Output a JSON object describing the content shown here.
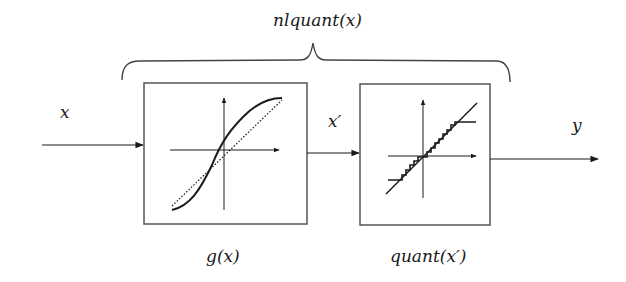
{
  "diagram": {
    "title": "nlquant(x)",
    "input_label": "x",
    "intermediate_label": "x′",
    "output_label": "y",
    "blocks": [
      {
        "id": "g",
        "caption": "g(x)",
        "plot": "sigmoid curve vs dotted identity line"
      },
      {
        "id": "quant",
        "caption": "quant(x′)",
        "plot": "staircase quantizer vs identity line"
      }
    ],
    "colors": {
      "stroke": "#1a1a1a",
      "box": "#555555",
      "background": "#ffffff"
    }
  }
}
